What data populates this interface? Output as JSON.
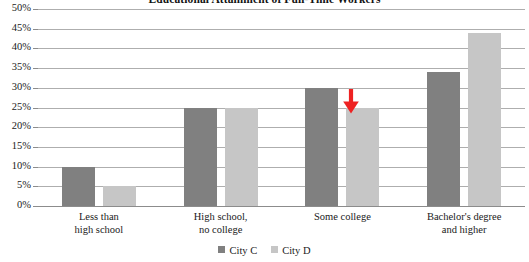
{
  "chart_data": {
    "type": "bar",
    "title": "Educational Attainment of Full-Time Workers",
    "xlabel": "",
    "ylabel": "",
    "ylim": [
      0,
      50
    ],
    "ytick_step": 5,
    "grid": true,
    "legend_position": "bottom",
    "categories": [
      "Less than\nhigh school",
      "High school,\nno college",
      "Some college",
      "Bachelor's degree\nand higher"
    ],
    "category_lines": [
      [
        "Less than",
        "high school"
      ],
      [
        "High school,",
        "no college"
      ],
      [
        "Some college",
        ""
      ],
      [
        "Bachelor's degree",
        "and higher"
      ]
    ],
    "ytick_labels": [
      "50%",
      "45%",
      "40%",
      "35%",
      "30%",
      "25%",
      "20%",
      "15%",
      "10%",
      "5%",
      "0%"
    ],
    "ytick_values": [
      50,
      45,
      40,
      35,
      30,
      25,
      20,
      15,
      10,
      5,
      0
    ],
    "series": [
      {
        "name": "City C",
        "color": "#808080",
        "values": [
          10,
          25,
          30,
          34
        ]
      },
      {
        "name": "City D",
        "color": "#c6c6c6",
        "values": [
          5,
          25,
          25,
          44
        ]
      }
    ],
    "annotations": [
      {
        "kind": "arrow-down",
        "color": "#ee2222",
        "points_at_category": "Some college",
        "points_at_series": "City D",
        "points_at_value": 25
      }
    ]
  },
  "colors": {
    "series_c": "#808080",
    "series_d": "#c6c6c6",
    "gridline": "#aeaeae",
    "axis": "#8c8c8c",
    "annotation": "#ee2222",
    "text": "#1a1a1a",
    "background": "#ffffff"
  }
}
